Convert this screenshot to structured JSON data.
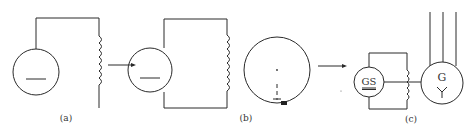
{
  "figure": {
    "panels": [
      {
        "id": "a",
        "label": "(a)"
      },
      {
        "id": "b",
        "label": "(b)"
      },
      {
        "id": "c",
        "label": "(c)"
      }
    ],
    "symbols": {
      "exciter": "GS",
      "generator": "G"
    },
    "colors": {
      "background": "#ffffff",
      "line": "#2a2a2a"
    }
  }
}
